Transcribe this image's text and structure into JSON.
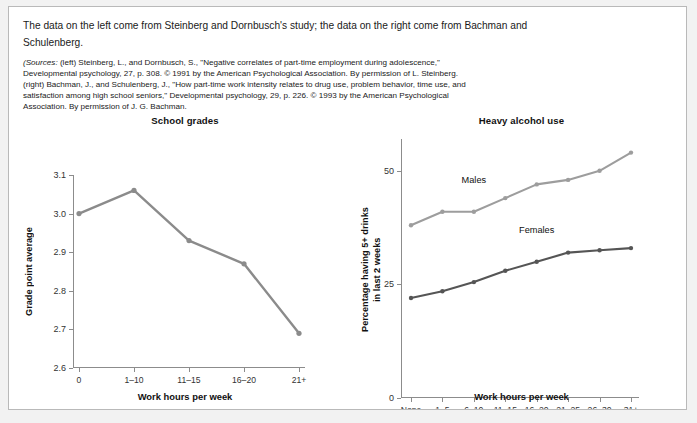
{
  "figure": {
    "intro_text": "The data on the left come from Steinberg and Dornbusch's study; the data on the right come from Bachman and Schulenberg.",
    "sources_prefix": "(Sources:",
    "sources_text": " (left) Steinberg, L., and Dornbusch, S., \"Negative correlates of part-time employment during adolescence,\" Developmental psychology, 27, p. 308. © 1991 by the American Psychological Association. By permission of L. Steinberg. (right) Bachman, J., and Schulenberg, J., \"How part-time work intensity relates to drug use, problem behavior, time use, and satisfaction among high school seniors,\" Developmental psychology, 29, p. 226. © 1993 by the American Psychological Association. By permission of J. G. Bachman.",
    "border_color": "#b9b9b9",
    "background": "#ffffff"
  },
  "chart_data": [
    {
      "type": "line",
      "id": "school-grades",
      "title": "School grades",
      "xlabel": "Work hours per week",
      "ylabel": "Grade point average",
      "categories": [
        "0",
        "1–10",
        "11–15",
        "16–20",
        "21+"
      ],
      "values": [
        3.0,
        3.06,
        2.93,
        2.87,
        2.69
      ],
      "yticks": [
        2.6,
        2.7,
        2.8,
        2.9,
        3.0,
        3.1
      ],
      "ytick_labels": [
        "2.6",
        "2.7",
        "2.8",
        "2.9",
        "3.0",
        "3.1"
      ],
      "ylim": [
        2.6,
        3.1
      ],
      "grid": false,
      "legend": "none",
      "line_color": "#8b8b8b",
      "marker": "circle"
    },
    {
      "type": "line",
      "id": "heavy-alcohol-use",
      "title": "Heavy alcohol use",
      "xlabel": "Work hours per week",
      "ylabel_line1": "Percentage having 5+ drinks",
      "ylabel_line2": "in last 2 weeks",
      "categories": [
        "None",
        "1–5",
        "6–10",
        "11–15",
        "16–20",
        "21–25",
        "26–30",
        "31+"
      ],
      "series": [
        {
          "name": "Males",
          "values": [
            38,
            41,
            41,
            44,
            47,
            48,
            50,
            54
          ],
          "color": "#9d9d9d",
          "label_x_index": 2,
          "label_y": 48
        },
        {
          "name": "Females",
          "values": [
            22,
            23.5,
            25.5,
            28,
            30,
            32,
            32.5,
            33
          ],
          "color": "#555555",
          "label_x_index": 4,
          "label_y": 37
        }
      ],
      "yticks": [
        0,
        25,
        50
      ],
      "ytick_labels": [
        "0",
        "25",
        "50"
      ],
      "ylim": [
        0,
        57
      ],
      "grid": false,
      "legend": "inline-labels"
    }
  ]
}
